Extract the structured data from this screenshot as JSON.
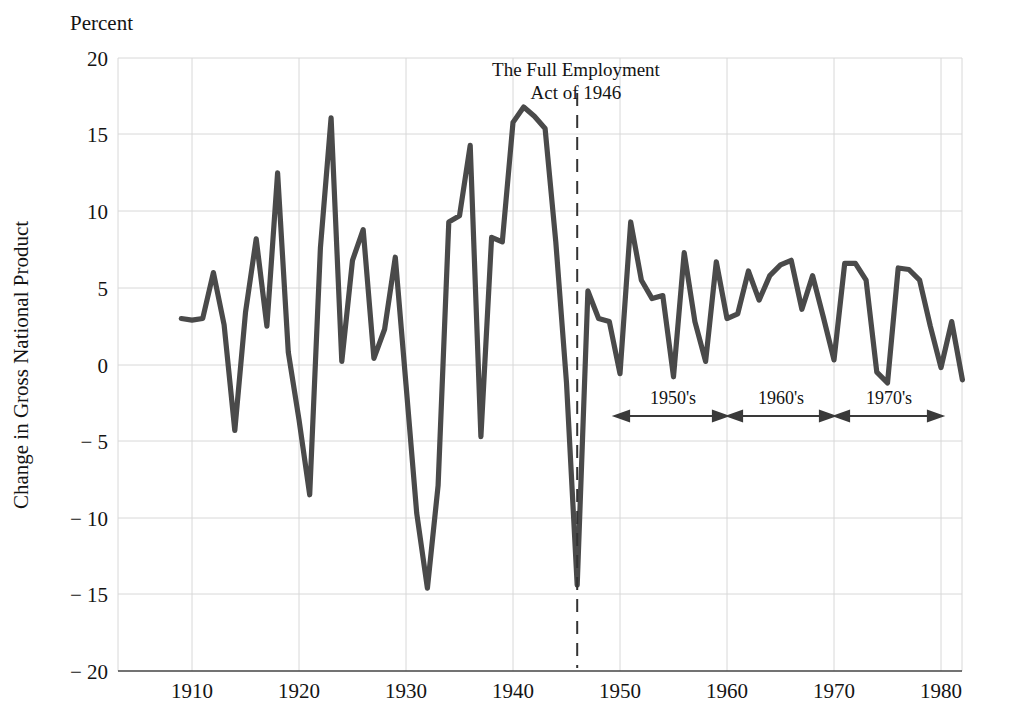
{
  "chart_data": {
    "type": "line",
    "title": "",
    "unit_label": "Percent",
    "ylabel": "Change in Gross National Product",
    "xlabel": "",
    "xlim": [
      1908,
      1983
    ],
    "ylim": [
      -20,
      20
    ],
    "xticks": [
      1910,
      1920,
      1930,
      1940,
      1950,
      1960,
      1970,
      1980
    ],
    "xtick_labels": [
      "1910",
      "1920",
      "1930",
      "1940",
      "1950",
      "1960",
      "1970",
      "1980"
    ],
    "yticks": [
      20,
      15,
      10,
      5,
      0,
      -5,
      -10,
      -15,
      -20
    ],
    "ytick_labels": [
      "20",
      "15",
      "10",
      "5",
      "0",
      "− 5",
      "− 10",
      "− 15",
      "− 20"
    ],
    "grid": true,
    "legend": "none",
    "line_color": "#4a4a4a",
    "series": [
      {
        "name": "Change in Gross National Product",
        "x": [
          1909,
          1910,
          1911,
          1912,
          1913,
          1914,
          1915,
          1916,
          1917,
          1918,
          1919,
          1920,
          1921,
          1922,
          1923,
          1924,
          1925,
          1926,
          1927,
          1928,
          1929,
          1930,
          1931,
          1932,
          1933,
          1934,
          1935,
          1936,
          1937,
          1938,
          1939,
          1940,
          1941,
          1942,
          1943,
          1944,
          1945,
          1946,
          1947,
          1948,
          1949,
          1950,
          1951,
          1952,
          1953,
          1954,
          1955,
          1956,
          1957,
          1958,
          1959,
          1960,
          1961,
          1962,
          1963,
          1964,
          1965,
          1966,
          1967,
          1968,
          1969,
          1970,
          1971,
          1972,
          1973,
          1974,
          1975,
          1976,
          1977,
          1978,
          1979,
          1980,
          1981,
          1982
        ],
        "values": [
          3.0,
          2.9,
          3.0,
          6.0,
          2.6,
          -4.3,
          3.4,
          8.2,
          2.5,
          12.5,
          0.8,
          -3.6,
          -8.5,
          7.6,
          16.1,
          0.2,
          6.8,
          8.8,
          0.4,
          2.3,
          7.0,
          -1.3,
          -9.7,
          -14.6,
          -7.9,
          9.3,
          9.7,
          14.3,
          -4.7,
          8.3,
          8.0,
          15.8,
          16.8,
          16.2,
          15.4,
          8.0,
          -1.2,
          -14.4,
          4.8,
          3.0,
          2.8,
          -0.6,
          9.3,
          5.5,
          4.3,
          4.5,
          -0.8,
          7.3,
          2.8,
          0.2,
          6.7,
          3.0,
          3.3,
          6.1,
          4.2,
          5.8,
          6.5,
          6.8,
          3.6,
          5.8,
          3.1,
          0.3,
          6.6,
          6.6,
          5.5,
          -0.5,
          -1.2,
          6.3,
          6.2,
          5.5,
          2.5,
          -0.2,
          2.8,
          -1.0
        ]
      }
    ],
    "annotations": [
      {
        "name": "full-employment-act",
        "line1": "The Full Employment",
        "line2": "Act of 1946",
        "marker_x": 1946,
        "marker_style": "dashed-vertical"
      },
      {
        "name": "decade-1950s",
        "label": "1950's",
        "from": 1950,
        "to": 1959
      },
      {
        "name": "decade-1960s",
        "label": "1960's",
        "from": 1960,
        "to": 1969
      },
      {
        "name": "decade-1970s",
        "label": "1970's",
        "from": 1970,
        "to": 1981
      }
    ]
  }
}
